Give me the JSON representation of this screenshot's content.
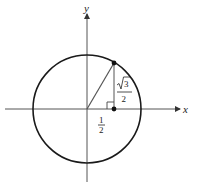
{
  "diagram": {
    "type": "unit-circle",
    "axes": {
      "x_label": "x",
      "y_label": "y"
    },
    "circle": {
      "center": [
        0,
        0
      ],
      "radius": 1
    },
    "point_on_circle": {
      "x": "1/2",
      "y": "√3/2"
    },
    "foot_point": {
      "x": "1/2",
      "y": "0"
    },
    "labels": {
      "horizontal_leg": {
        "numerator": "1",
        "denominator": "2"
      },
      "vertical_leg": {
        "numerator": "√3",
        "radicand": "3",
        "denominator": "2"
      }
    },
    "right_angle_marker": true,
    "colors": {
      "stroke": "#1a1a1a",
      "axis": "#444444",
      "background": "#ffffff"
    }
  }
}
